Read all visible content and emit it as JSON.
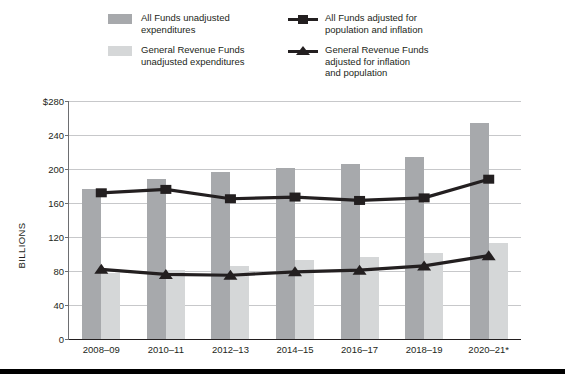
{
  "legend": {
    "entries": [
      {
        "id": "all-funds-unadjusted",
        "label": "All Funds unadjusted\nexpenditures",
        "marker": "swatch",
        "color": "#a7a9ac"
      },
      {
        "id": "general-revenue-unadjusted",
        "label": "General Revenue Funds\nunadjusted expenditures",
        "marker": "swatch",
        "color": "#d5d7d8"
      },
      {
        "id": "all-funds-adjusted",
        "label": "All Funds adjusted for\npopulation and inflation",
        "marker": "line-square",
        "color": "#231f20"
      },
      {
        "id": "general-revenue-adjusted",
        "label": "General Revenue Funds\nadjusted for inflation\nand population",
        "marker": "line-triangle",
        "color": "#231f20"
      }
    ]
  },
  "chart_data": {
    "type": "bar",
    "title": "",
    "xlabel": "",
    "ylabel": "BILLIONS",
    "ylim": [
      0,
      280
    ],
    "yticks": [
      0,
      40,
      80,
      120,
      160,
      200,
      240,
      280
    ],
    "ytick_labels": [
      "0",
      "40",
      "80",
      "120",
      "160",
      "200",
      "240",
      "$280"
    ],
    "grid": true,
    "legend_position": "top",
    "categories": [
      "2008–09",
      "2010–11",
      "2012–13",
      "2014–15",
      "2016–17",
      "2018–19",
      "2020–21*"
    ],
    "series": [
      {
        "name": "All Funds unadjusted expenditures",
        "type": "bar",
        "color": "#a7a9ac",
        "values": [
          177,
          188,
          196,
          201,
          206,
          214,
          254
        ]
      },
      {
        "name": "General Revenue Funds unadjusted expenditures",
        "type": "bar",
        "color": "#d5d7d8",
        "values": [
          78,
          81,
          86,
          93,
          97,
          101,
          113
        ]
      },
      {
        "name": "All Funds adjusted for population and inflation",
        "type": "line",
        "marker": "square",
        "color": "#231f20",
        "values": [
          172,
          176,
          165,
          167,
          163,
          166,
          188
        ]
      },
      {
        "name": "General Revenue Funds adjusted for inflation and population",
        "type": "line",
        "marker": "triangle",
        "color": "#231f20",
        "values": [
          82,
          76,
          75,
          79,
          81,
          86,
          98
        ]
      }
    ]
  }
}
